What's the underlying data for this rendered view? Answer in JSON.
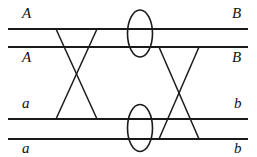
{
  "figure": {
    "type": "wiring-diagram",
    "width": 257,
    "height": 157,
    "background": "#ffffff",
    "stroke_color": "#1a1a1a"
  },
  "labels": {
    "left": [
      {
        "text": "A",
        "x": 22,
        "y": 6
      },
      {
        "text": "A",
        "x": 22,
        "y": 50
      },
      {
        "text": "a",
        "x": 22,
        "y": 96
      },
      {
        "text": "a",
        "x": 22,
        "y": 141
      }
    ],
    "right": [
      {
        "text": "B",
        "x": 232,
        "y": 6
      },
      {
        "text": "B",
        "x": 232,
        "y": 50
      },
      {
        "text": "b",
        "x": 234,
        "y": 96
      },
      {
        "text": "b",
        "x": 234,
        "y": 141
      }
    ]
  },
  "rails": [
    {
      "name": "rail-top-A-B",
      "y": 29,
      "x1": 8,
      "x2": 248
    },
    {
      "name": "rail-second-A-B",
      "y": 47,
      "x1": 8,
      "x2": 248
    },
    {
      "name": "rail-third-a-b",
      "y": 119,
      "x1": 8,
      "x2": 248
    },
    {
      "name": "rail-bottom-a-b",
      "y": 139,
      "x1": 8,
      "x2": 248
    }
  ],
  "crossings": [
    {
      "name": "left-crossing",
      "strand_1": {
        "x1": 56,
        "y1": 29,
        "x2": 97,
        "y2": 119
      },
      "strand_2": {
        "x1": 97,
        "y1": 29,
        "x2": 56,
        "y2": 119
      }
    },
    {
      "name": "right-crossing",
      "strand_1": {
        "x1": 159,
        "y1": 47,
        "x2": 199,
        "y2": 139
      },
      "strand_2": {
        "x1": 199,
        "y1": 47,
        "x2": 159,
        "y2": 139
      }
    }
  ],
  "loops": [
    {
      "name": "upper-loop",
      "cx": 140,
      "cy": 33.5,
      "rx": 12.5,
      "ry": 23.5
    },
    {
      "name": "lower-loop",
      "cx": 140,
      "cy": 128,
      "rx": 12.5,
      "ry": 23.5
    }
  ]
}
